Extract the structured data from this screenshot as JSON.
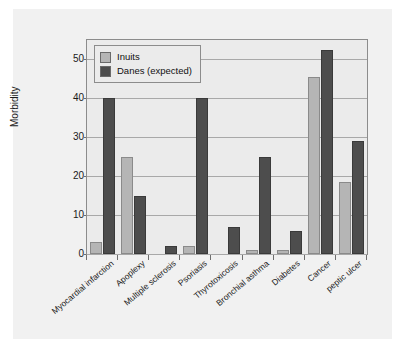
{
  "chart_data": {
    "type": "bar",
    "title": "",
    "subtitle": "",
    "xlabel": "",
    "ylabel": "Morbidity",
    "ylim": [
      0,
      55
    ],
    "yticks": [
      0,
      10,
      20,
      30,
      40,
      50
    ],
    "ytick_labels": [
      "0",
      "10",
      "20",
      "30",
      "40",
      "50"
    ],
    "grid": true,
    "legend_position": "top-left",
    "categories": [
      "Myocardial infarction",
      "Apoplexy",
      "Multiple sclerosis",
      "Psoriasis",
      "Thyrotoxicosis",
      "Bronchial asthma",
      "Diabetes",
      "Cancer",
      "peptic ulcer"
    ],
    "series": [
      {
        "name": "Inuits",
        "color": "#b5b5b5",
        "values": [
          3,
          25,
          0,
          2,
          0,
          1,
          1,
          45.5,
          18.5
        ]
      },
      {
        "name": "Danes (expected)",
        "color": "#4d4d4d",
        "values": [
          40,
          15,
          2,
          40,
          7,
          25,
          6,
          52.5,
          29
        ]
      }
    ]
  },
  "legend": {
    "entries": [
      {
        "label": "Inuits"
      },
      {
        "label": "Danes (expected)"
      }
    ]
  },
  "axes": {
    "y_title": "Morbidity"
  }
}
